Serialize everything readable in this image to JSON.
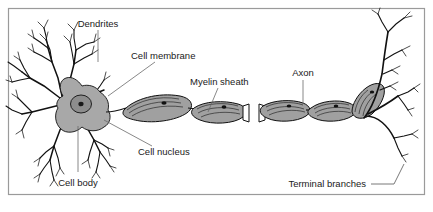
{
  "figure": {
    "background_color": "#ffffff",
    "frame_color": "#9a9a9a",
    "ink_color": "#111111",
    "cell_fill_color": "#a8a8a8",
    "myelin_fill_color": "#a0a0a0",
    "leader_color": "#6a6a6a"
  },
  "labels": {
    "dendrites": "Dendrites",
    "cell_membrane": "Cell membrane",
    "myelin_sheath": "Myelin sheath",
    "axon": "Axon",
    "cell_nucleus": "Cell nucleus",
    "cell_body": "Cell body",
    "terminal_branches": "Terminal branches"
  },
  "parts": [
    {
      "id": "dendrites",
      "label": "Dendrites",
      "region": "upper-left branching processes"
    },
    {
      "id": "cell-membrane",
      "label": "Cell membrane",
      "region": "outer boundary of soma"
    },
    {
      "id": "cell-nucleus",
      "label": "Cell nucleus",
      "region": "center of soma"
    },
    {
      "id": "cell-body",
      "label": "Cell body",
      "region": "soma"
    },
    {
      "id": "myelin-sheath",
      "label": "Myelin sheath",
      "region": "segmented covering along axon"
    },
    {
      "id": "axon",
      "label": "Axon",
      "region": "long fiber from soma to terminals"
    },
    {
      "id": "terminal-branches",
      "label": "Terminal branches",
      "region": "right end fine branches"
    }
  ]
}
